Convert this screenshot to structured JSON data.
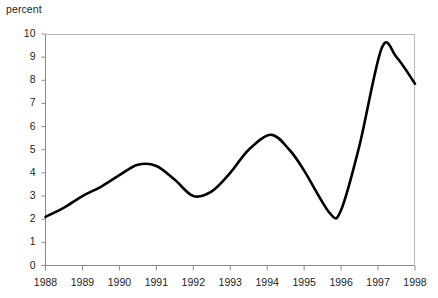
{
  "chart_data": {
    "type": "line",
    "title": "",
    "subtitle": "",
    "xlabel": "",
    "ylabel": "percent",
    "yunit_label": "percent",
    "xlim": [
      1988,
      1998
    ],
    "ylim": [
      0,
      10
    ],
    "grid": false,
    "legend": "none",
    "line_color": "#000000",
    "axis_color": "#808080",
    "xticks": [
      "1988",
      "1989",
      "1990",
      "1991",
      "1992",
      "1993",
      "1994",
      "1995",
      "1996",
      "1997",
      "1998"
    ],
    "yticks": [
      "0",
      "1",
      "2",
      "3",
      "4",
      "5",
      "6",
      "7",
      "8",
      "9",
      "10"
    ],
    "series": [
      {
        "name": "percent",
        "x": [
          1988.0,
          1988.5,
          1989.0,
          1989.5,
          1990.0,
          1990.5,
          1991.0,
          1991.5,
          1992.0,
          1992.5,
          1993.0,
          1993.5,
          1994.1,
          1994.6,
          1995.0,
          1995.7,
          1996.0,
          1996.5,
          1997.1,
          1997.5,
          1998.0
        ],
        "values": [
          2.1,
          2.5,
          3.0,
          3.4,
          3.9,
          4.35,
          4.3,
          3.7,
          3.0,
          3.2,
          4.0,
          5.0,
          5.65,
          5.0,
          4.1,
          2.25,
          2.4,
          5.2,
          9.4,
          9.0,
          7.85
        ],
        "annotations": [
          {
            "label": "start",
            "x": 1988.0,
            "y": 2.1
          },
          {
            "label": "local peak",
            "x": 1990.5,
            "y": 4.35
          },
          {
            "label": "local trough",
            "x": 1992.0,
            "y": 3.0
          },
          {
            "label": "local peak",
            "x": 1994.1,
            "y": 5.65
          },
          {
            "label": "local trough",
            "x": 1995.7,
            "y": 2.25
          },
          {
            "label": "global peak",
            "x": 1997.1,
            "y": 9.4
          },
          {
            "label": "end",
            "x": 1998.0,
            "y": 7.85
          }
        ]
      }
    ]
  }
}
